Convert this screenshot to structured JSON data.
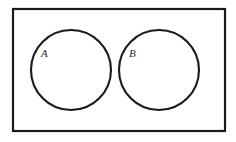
{
  "diagram": {
    "kind": "venn-diagram",
    "canvas": {
      "width": 236,
      "height": 142,
      "background_color": "#ffffff"
    },
    "universe": {
      "name": "universal-set-rectangle",
      "x": 13,
      "y": 9,
      "width": 212,
      "height": 122,
      "stroke_color": "#1a1a1a",
      "stroke_width": 2.2,
      "fill_color": "#ffffff"
    },
    "sets": [
      {
        "label": "A",
        "name": "set-a",
        "cx": 71,
        "cy": 70,
        "r": 40,
        "stroke_color": "#1a1a1a",
        "stroke_width": 2.1,
        "fill_color": "none",
        "label_x": 41,
        "label_y": 57
      },
      {
        "label": "B",
        "name": "set-b",
        "cx": 159,
        "cy": 70,
        "r": 40,
        "stroke_color": "#1a1a1a",
        "stroke_width": 2.1,
        "fill_color": "none",
        "label_x": 129,
        "label_y": 57
      }
    ],
    "relationship": "disjoint"
  }
}
